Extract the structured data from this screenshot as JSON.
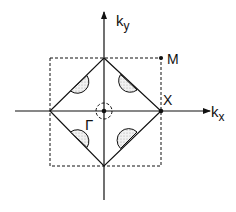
{
  "diagram": {
    "type": "brillouin-zone",
    "labels": {
      "ky_main": "k",
      "ky_sub": "y",
      "kx_main": "k",
      "kx_sub": "x",
      "gamma": "Γ",
      "x_point": "X",
      "m_point": "M"
    },
    "colors": {
      "line": "#111111",
      "pocket_fill": "#e6e6e6",
      "background": "#ffffff"
    }
  }
}
